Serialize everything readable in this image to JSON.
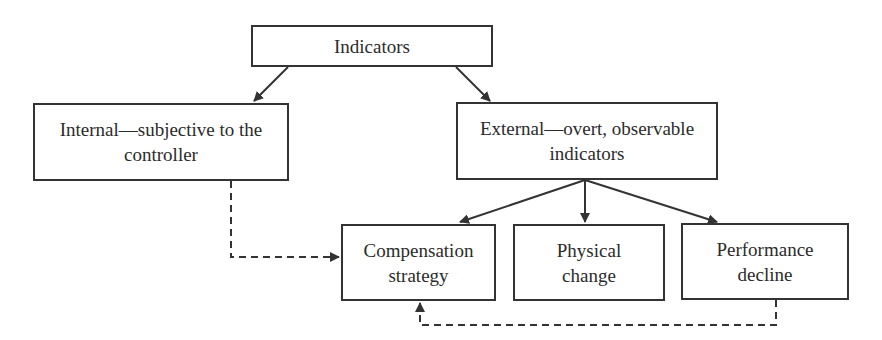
{
  "diagram": {
    "type": "flowchart",
    "nodes": {
      "indicators": {
        "label": "Indicators"
      },
      "internal": {
        "label": "Internal—subjective to the controller"
      },
      "external": {
        "label": "External—overt, observable indicators"
      },
      "compensation": {
        "label": "Compensation strategy"
      },
      "physical": {
        "label": "Physical change"
      },
      "performance": {
        "label": "Performance decline"
      }
    },
    "edges": [
      {
        "from": "indicators",
        "to": "internal",
        "style": "solid"
      },
      {
        "from": "indicators",
        "to": "external",
        "style": "solid"
      },
      {
        "from": "external",
        "to": "compensation",
        "style": "solid"
      },
      {
        "from": "external",
        "to": "physical",
        "style": "solid"
      },
      {
        "from": "external",
        "to": "performance",
        "style": "solid"
      },
      {
        "from": "internal",
        "to": "compensation",
        "style": "dashed"
      },
      {
        "from": "performance",
        "to": "compensation",
        "style": "dashed"
      }
    ],
    "colors": {
      "stroke": "#333333",
      "background": "#ffffff",
      "text": "#2b2b2b"
    }
  }
}
